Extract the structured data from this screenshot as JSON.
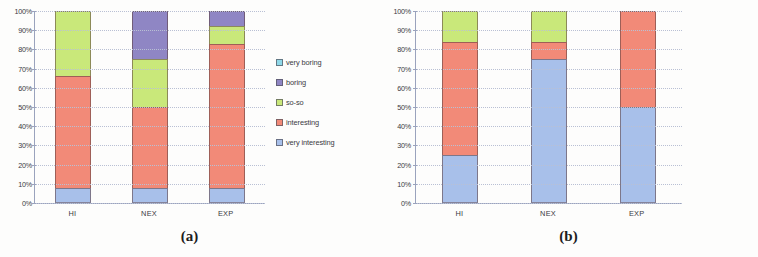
{
  "figure": {
    "panels": [
      {
        "id": "a",
        "caption": "(a)",
        "legend_items": [
          {
            "label": "very boring",
            "color": "#8fd8e8"
          },
          {
            "label": "boring",
            "color": "#8f86c4"
          },
          {
            "label": "so-so",
            "color": "#c9e87a"
          },
          {
            "label": "interesting",
            "color": "#f28a78"
          },
          {
            "label": "very interesting",
            "color": "#a8c0ea"
          }
        ]
      },
      {
        "id": "b",
        "caption": "(b)",
        "legend_items": [
          {
            "label": "Speech",
            "color": "#c9e87a"
          },
          {
            "label": "Music",
            "color": "#f28a78"
          },
          {
            "label": "Mixed",
            "color": "#a8c0ea"
          }
        ]
      }
    ],
    "y_ticks": [
      "100%",
      "90%",
      "80%",
      "70%",
      "60%",
      "50%",
      "40%",
      "30%",
      "20%",
      "10%",
      "0%"
    ]
  },
  "chart_data": [
    {
      "type": "bar",
      "subtype": "stacked-100-percent",
      "title": "(a)",
      "xlabel": "",
      "ylabel": "",
      "ylim": [
        0,
        100
      ],
      "ytick_labels": [
        "0%",
        "10%",
        "20%",
        "30%",
        "40%",
        "50%",
        "60%",
        "70%",
        "80%",
        "90%",
        "100%"
      ],
      "grid": true,
      "legend_position": "right",
      "categories": [
        "HI",
        "NEX",
        "EXP"
      ],
      "series": [
        {
          "name": "very interesting",
          "color": "#a8c0ea",
          "values": [
            8,
            8,
            8
          ]
        },
        {
          "name": "interesting",
          "color": "#f28a78",
          "values": [
            58,
            42,
            75
          ]
        },
        {
          "name": "so-so",
          "color": "#c9e87a",
          "values": [
            34,
            25,
            9
          ]
        },
        {
          "name": "boring",
          "color": "#8f86c4",
          "values": [
            0,
            25,
            8
          ]
        },
        {
          "name": "very boring",
          "color": "#8fd8e8",
          "values": [
            0,
            0,
            0
          ]
        }
      ]
    },
    {
      "type": "bar",
      "subtype": "stacked-100-percent",
      "title": "(b)",
      "xlabel": "",
      "ylabel": "",
      "ylim": [
        0,
        100
      ],
      "ytick_labels": [
        "0%",
        "10%",
        "20%",
        "30%",
        "40%",
        "50%",
        "60%",
        "70%",
        "80%",
        "90%",
        "100%"
      ],
      "grid": true,
      "legend_position": "right",
      "categories": [
        "HI",
        "NEX",
        "EXP"
      ],
      "series": [
        {
          "name": "Mixed",
          "color": "#a8c0ea",
          "values": [
            25,
            75,
            50
          ]
        },
        {
          "name": "Music",
          "color": "#f28a78",
          "values": [
            59,
            9,
            50
          ]
        },
        {
          "name": "Speech",
          "color": "#c9e87a",
          "values": [
            16,
            16,
            0
          ]
        }
      ]
    }
  ]
}
